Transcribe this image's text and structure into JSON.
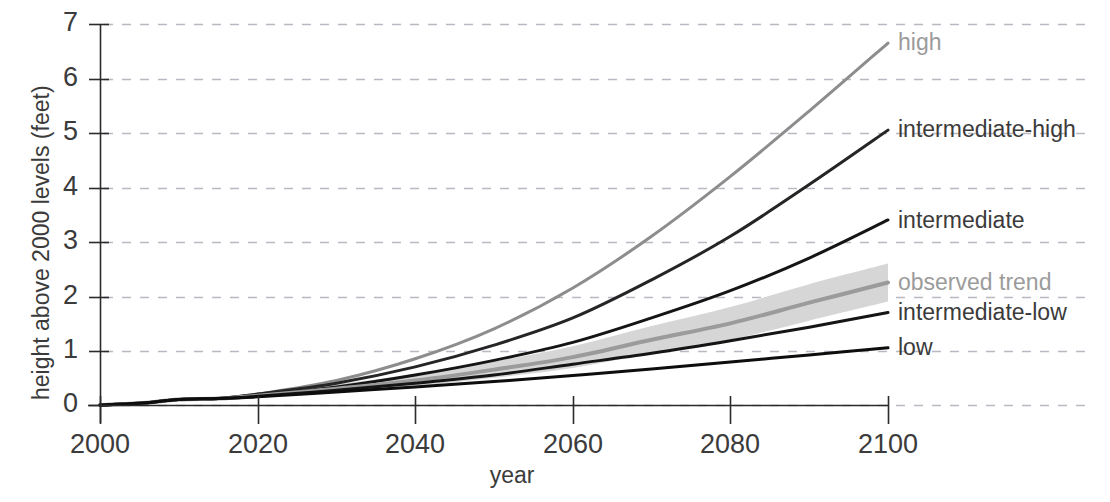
{
  "chart_data": {
    "type": "line",
    "title": "",
    "xlabel": "year",
    "ylabel": "height above 2000 levels (feet)",
    "xlim": [
      2000,
      2100
    ],
    "ylim": [
      0,
      7
    ],
    "xticks": [
      "2000",
      "2020",
      "2040",
      "2060",
      "2080",
      "2100"
    ],
    "yticks": [
      "0",
      "1",
      "2",
      "3",
      "4",
      "5",
      "6",
      "7"
    ],
    "grid": "horizontal dashed gridlines at each y tick",
    "legend_position": "right of plot, at end of each line",
    "x": [
      2000,
      2005,
      2010,
      2015,
      2020,
      2030,
      2040,
      2050,
      2060,
      2070,
      2080,
      2090,
      2100
    ],
    "series": [
      {
        "name": "high",
        "label": "high",
        "color": "#8d8d8d",
        "values": [
          0.0,
          0.03,
          0.1,
          0.12,
          0.2,
          0.45,
          0.85,
          1.4,
          2.15,
          3.1,
          4.2,
          5.4,
          6.65
        ]
      },
      {
        "name": "intermediate-high",
        "label": "intermediate-high",
        "color": "#252525",
        "values": [
          0.0,
          0.03,
          0.1,
          0.12,
          0.2,
          0.4,
          0.7,
          1.1,
          1.6,
          2.3,
          3.1,
          4.05,
          5.05
        ]
      },
      {
        "name": "intermediate",
        "label": "intermediate",
        "color": "#151515",
        "values": [
          0.0,
          0.03,
          0.1,
          0.12,
          0.18,
          0.33,
          0.55,
          0.82,
          1.15,
          1.6,
          2.1,
          2.7,
          3.4
        ]
      },
      {
        "name": "observed trend",
        "label": "observed trend",
        "color": "#9b9b9b",
        "band_color": "#d6d6d6",
        "values": [
          0.0,
          0.03,
          0.1,
          0.12,
          0.17,
          0.3,
          0.45,
          0.65,
          0.88,
          1.2,
          1.5,
          1.88,
          2.25
        ],
        "band_low": [
          0.0,
          0.03,
          0.08,
          0.1,
          0.13,
          0.22,
          0.34,
          0.5,
          0.68,
          0.95,
          1.2,
          1.55,
          1.9
        ],
        "band_high": [
          0.0,
          0.04,
          0.12,
          0.15,
          0.22,
          0.38,
          0.57,
          0.8,
          1.08,
          1.45,
          1.8,
          2.22,
          2.6
        ]
      },
      {
        "name": "intermediate-low",
        "label": "intermediate-low",
        "color": "#151515",
        "values": [
          0.0,
          0.03,
          0.1,
          0.12,
          0.16,
          0.27,
          0.4,
          0.55,
          0.75,
          0.95,
          1.18,
          1.43,
          1.7
        ]
      },
      {
        "name": "low",
        "label": "low",
        "color": "#0d0d0d",
        "values": [
          0.0,
          0.03,
          0.1,
          0.12,
          0.15,
          0.24,
          0.33,
          0.43,
          0.54,
          0.66,
          0.79,
          0.92,
          1.05
        ]
      }
    ],
    "historical_wiggle": {
      "note": "small observed record wiggle from 2000-2018 common to all series",
      "x": [
        2000,
        2003,
        2006,
        2009,
        2012,
        2015,
        2018
      ],
      "y": [
        0.0,
        0.02,
        0.06,
        0.12,
        0.11,
        0.14,
        0.2
      ]
    },
    "series_label_positions_px": [
      {
        "name": "high",
        "x": 898,
        "y": 43
      },
      {
        "name": "intermediate-high",
        "x": 898,
        "y": 130
      },
      {
        "name": "intermediate",
        "x": 898,
        "y": 221
      },
      {
        "name": "observed trend",
        "x": 898,
        "y": 283
      },
      {
        "name": "intermediate-low",
        "x": 898,
        "y": 313
      },
      {
        "name": "low",
        "x": 898,
        "y": 348
      }
    ]
  },
  "axes": {
    "x_title": "year",
    "y_title": "height above 2000 levels (feet)",
    "x_ticks": [
      {
        "label": "2000",
        "px": 100
      },
      {
        "label": "2020",
        "px": 258
      },
      {
        "label": "2040",
        "px": 415
      },
      {
        "label": "2060",
        "px": 573
      },
      {
        "label": "2080",
        "px": 730
      },
      {
        "label": "2100",
        "px": 888
      }
    ],
    "y_ticks": [
      {
        "label": "7",
        "px": 24
      },
      {
        "label": "6",
        "px": 79
      },
      {
        "label": "5",
        "px": 133
      },
      {
        "label": "4",
        "px": 188
      },
      {
        "label": "3",
        "px": 242
      },
      {
        "label": "2",
        "px": 297
      },
      {
        "label": "1",
        "px": 351
      },
      {
        "label": "0",
        "px": 405
      }
    ]
  },
  "colors": {
    "axis": "#2b2b2b",
    "grid": "#b9b9c4",
    "text": "#3b3b3b",
    "muted_text": "#9b9b9b",
    "background": "#ffffff"
  }
}
